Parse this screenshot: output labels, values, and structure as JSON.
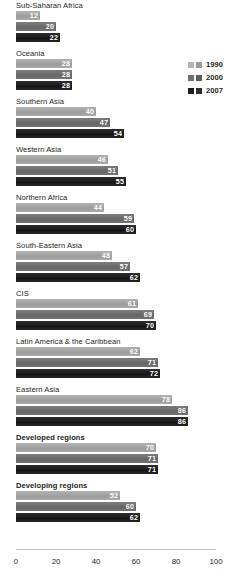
{
  "chart_data": {
    "type": "bar",
    "orientation": "horizontal",
    "title": "",
    "subtitle": "",
    "xlabel": "",
    "ylabel": "",
    "xlim": [
      0,
      100
    ],
    "grid": false,
    "legend_position": "top-right",
    "categories": [
      "Sub-Saharan Africa",
      "Oceania",
      "Southern Asia",
      "Western Asia",
      "Northern Africa",
      "South-Eastern Asia",
      "CIS",
      "Latin America & the Caribbean",
      "Eastern Asia",
      "Developed regions",
      "Developing regions"
    ],
    "series": [
      {
        "name": "1990",
        "color": "#a5a5a5",
        "values": [
          12,
          28,
          40,
          46,
          44,
          48,
          61,
          62,
          78,
          70,
          52
        ]
      },
      {
        "name": "2000",
        "color": "#6b6b6b",
        "values": [
          20,
          28,
          47,
          51,
          59,
          57,
          69,
          71,
          86,
          71,
          60
        ]
      },
      {
        "name": "2007",
        "color": "#1a1a1a",
        "values": [
          22,
          28,
          54,
          55,
          60,
          62,
          70,
          72,
          86,
          71,
          62
        ]
      }
    ],
    "ticks": [
      0,
      20,
      40,
      60,
      80,
      100
    ],
    "tick_labels": [
      "0",
      "20",
      "40",
      "60",
      "80",
      "100"
    ],
    "emphasized_categories": [
      "Developed regions",
      "Developing regions"
    ],
    "value_label_color": "#ffffff",
    "axis_line_color": "#bfbfbf",
    "background_color": "#ffffff"
  },
  "legend": {
    "items": [
      {
        "label": "1990",
        "swatch_a": "#b5b5b5",
        "swatch_b": "#9a9a9a"
      },
      {
        "label": "2000",
        "swatch_a": "#6f6f6f",
        "swatch_b": "#5c5c5c"
      },
      {
        "label": "2007",
        "swatch_a": "#1f1f1f",
        "swatch_b": "#2e2e2e"
      }
    ]
  }
}
